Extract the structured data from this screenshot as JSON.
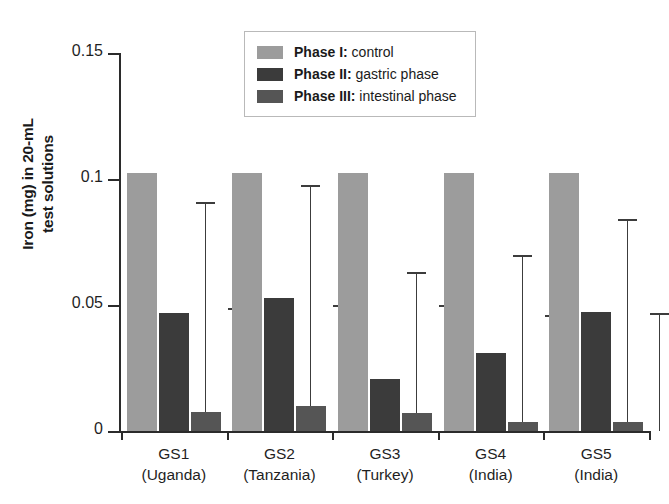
{
  "chart_data": {
    "type": "bar",
    "title": "",
    "subtitle": "",
    "xlabel": "",
    "ylabel": "Iron (mg) in 20-mL test solutions",
    "ylabel_lines": [
      "Iron (mg) in 20-mL",
      "test solutions"
    ],
    "ylim": [
      0,
      0.15
    ],
    "yticks": [
      0,
      0.05,
      0.1,
      0.15
    ],
    "ytick_labels": [
      "0",
      "0.05",
      "0.1",
      "0.15"
    ],
    "grid": false,
    "legend_position": "top-center",
    "categories": [
      "GS1",
      "GS2",
      "GS3",
      "GS4",
      "GS5"
    ],
    "category_sublabels": [
      "(Uganda)",
      "(Tanzania)",
      "(Turkey)",
      "(India)",
      "(India)"
    ],
    "category_labels": [
      [
        "GS1",
        "(Uganda)"
      ],
      [
        "GS2",
        "(Tanzania)"
      ],
      [
        "GS3",
        "(Turkey)"
      ],
      [
        "GS4",
        "(India)"
      ],
      [
        "GS5",
        "(India)"
      ]
    ],
    "series": [
      {
        "name": "Phase I: control",
        "name_bold": "Phase I:",
        "name_rest": " control",
        "color": "#9c9c9c",
        "values": [
          0.1025,
          0.1025,
          0.1025,
          0.1025,
          0.1023
        ],
        "errors_upper": [
          null,
          null,
          null,
          null,
          null
        ]
      },
      {
        "name": "Phase II: gastric phase",
        "name_bold": "Phase II:",
        "name_rest": " gastric phase",
        "color": "#3b3b3b",
        "values": [
          0.0468,
          0.0528,
          0.0205,
          0.031,
          0.0473
        ],
        "errors_upper": [
          0.091,
          0.0975,
          0.0632,
          0.07,
          0.0843
        ]
      },
      {
        "name": "Phase III: intestinal phase",
        "name_bold": "Phase III:",
        "name_rest": " intestinal phase",
        "color": "#555555",
        "values": [
          0.0076,
          0.0101,
          0.0073,
          0.0035,
          0.0037
        ],
        "errors_upper": [
          0.0488,
          0.05,
          0.05,
          0.046,
          0.047
        ]
      }
    ]
  },
  "legend": {
    "items": [
      {
        "bold": "Phase I:",
        "rest": " control",
        "swatch": "#9c9c9c"
      },
      {
        "bold": "Phase II:",
        "rest": " gastric phase",
        "swatch": "#3b3b3b"
      },
      {
        "bold": "Phase III:",
        "rest": " intestinal phase",
        "swatch": "#555555"
      }
    ]
  }
}
